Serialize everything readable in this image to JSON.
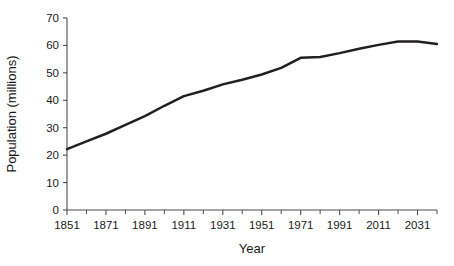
{
  "chart_data": {
    "type": "line",
    "title": "",
    "xlabel": "Year",
    "ylabel": "Population (millions)",
    "xlim": [
      1851,
      2041
    ],
    "ylim": [
      0,
      70
    ],
    "grid": false,
    "legend": "none",
    "y_ticks": [
      0,
      10,
      20,
      30,
      40,
      50,
      60,
      70
    ],
    "y_tick_labels": [
      "0",
      "10",
      "20",
      "30",
      "40",
      "50",
      "60",
      "70"
    ],
    "x_ticks": [
      1851,
      1871,
      1891,
      1911,
      1931,
      1951,
      1971,
      1991,
      2011,
      2031
    ],
    "x_tick_labels": [
      "1851",
      "1871",
      "1891",
      "1911",
      "1931",
      "1951",
      "1971",
      "1991",
      "2011",
      "2031"
    ],
    "x_minor_tick_interval": 10,
    "series": [
      {
        "name": "Population",
        "color": "#231f20",
        "x": [
          1851,
          1861,
          1871,
          1881,
          1891,
          1901,
          1911,
          1921,
          1931,
          1941,
          1951,
          1961,
          1971,
          1981,
          1991,
          2001,
          2011,
          2021,
          2031,
          2041
        ],
        "values": [
          22.2,
          25.0,
          27.8,
          31.0,
          34.2,
          38.0,
          41.5,
          43.5,
          45.8,
          47.5,
          49.4,
          51.8,
          55.5,
          55.8,
          57.2,
          58.8,
          60.2,
          61.4,
          61.4,
          60.5
        ]
      }
    ]
  },
  "axis": {
    "y_title": "Population (millions)",
    "x_title": "Year"
  }
}
